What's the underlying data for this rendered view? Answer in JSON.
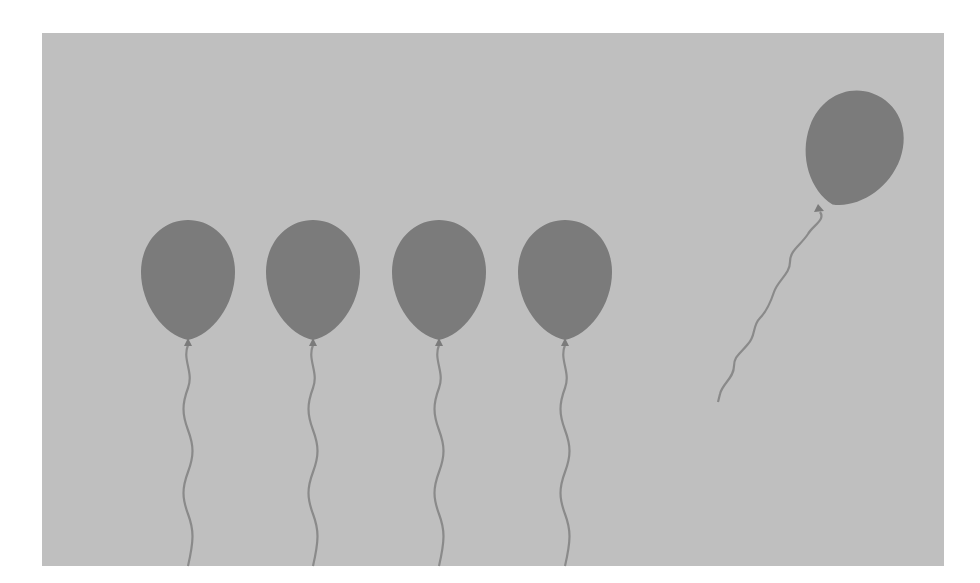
{
  "scene": {
    "description": "Grayscale illustration: four balloons in a row with wavy strings, one balloon floating away",
    "colors": {
      "page_background": "#ffffff",
      "panel_background": "#bfbfbf",
      "balloon_fill": "#7b7b7b",
      "string_stroke": "#8a8a8a"
    },
    "panel": {
      "x": 42,
      "y": 33,
      "width": 902,
      "height": 533
    },
    "tethered_balloons": [
      {
        "id": "balloon-1",
        "cx": 188,
        "cy": 278,
        "rx": 47,
        "ry": 59,
        "knot_y": 343
      },
      {
        "id": "balloon-2",
        "cx": 313,
        "cy": 278,
        "rx": 47,
        "ry": 59,
        "knot_y": 343
      },
      {
        "id": "balloon-3",
        "cx": 439,
        "cy": 278,
        "rx": 47,
        "ry": 59,
        "knot_y": 343
      },
      {
        "id": "balloon-4",
        "cx": 565,
        "cy": 278,
        "rx": 47,
        "ry": 59,
        "knot_y": 343
      }
    ],
    "floating_balloon": {
      "id": "balloon-floating",
      "cx": 853,
      "cy": 148,
      "rx": 48,
      "ry": 58,
      "rotation": 20,
      "knot": {
        "x": 819,
        "y": 210
      },
      "string_end": {
        "x": 718,
        "y": 402
      }
    }
  }
}
